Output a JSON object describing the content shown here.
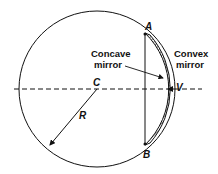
{
  "diagram": {
    "labels": {
      "point_a": "A",
      "point_b": "B",
      "center": "C",
      "radius": "R",
      "vertex": "V",
      "concave_line1": "Concave",
      "concave_line2": "mirror",
      "convex_line1": "Convex",
      "convex_line2": "mirror"
    },
    "colors": {
      "stroke": "#111111",
      "background": "#ffffff",
      "hatch": "#333333"
    }
  }
}
